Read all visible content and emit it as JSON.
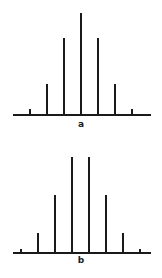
{
  "chart_data": [
    {
      "type": "bar",
      "title": "",
      "label": "a",
      "xlabel": "",
      "ylabel": "",
      "categories": [
        "0",
        "1",
        "2",
        "3",
        "4",
        "5",
        "6"
      ],
      "values": [
        1,
        6,
        15,
        20,
        15,
        6,
        1
      ],
      "ylim": [
        0,
        20
      ],
      "grid": false,
      "style": "stick"
    },
    {
      "type": "bar",
      "title": "",
      "label": "b",
      "xlabel": "",
      "ylabel": "",
      "categories": [
        "0",
        "1",
        "2",
        "3",
        "4",
        "5",
        "6",
        "7"
      ],
      "values": [
        1,
        7,
        21,
        35,
        35,
        21,
        7,
        1
      ],
      "ylim": [
        0,
        35
      ],
      "grid": false,
      "style": "stick"
    }
  ],
  "panels": {
    "a": {
      "label": "a"
    },
    "b": {
      "label": "b"
    }
  }
}
